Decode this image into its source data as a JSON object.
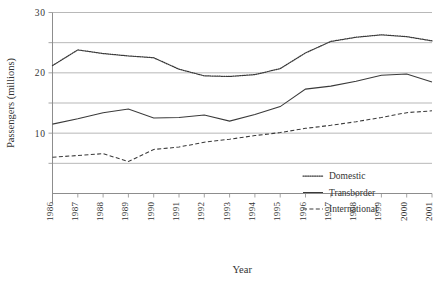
{
  "chart_data": {
    "type": "line",
    "title": "",
    "xlabel": "Year",
    "ylabel": "Passengers (millions)",
    "ylim": [
      0,
      30
    ],
    "ytick_labels": [
      "30",
      "20",
      "10"
    ],
    "ytick_values": [
      30,
      20,
      10
    ],
    "gridlines": [
      30,
      25,
      20,
      15,
      10,
      5
    ],
    "grid": true,
    "legend_position": "lower-right-inside",
    "categories": [
      "1986",
      "1987",
      "1988",
      "1989",
      "1990",
      "1991",
      "1992",
      "1993",
      "1994",
      "1995",
      "1996",
      "1997",
      "1998",
      "1999",
      "2000",
      "2001"
    ],
    "x": [
      1986,
      1987,
      1988,
      1989,
      1990,
      1991,
      1992,
      1993,
      1994,
      1995,
      1996,
      1997,
      1998,
      1999,
      2000,
      2001
    ],
    "series": [
      {
        "name": "Domestic",
        "style": "dotted",
        "values": [
          21.2,
          23.8,
          23.2,
          22.8,
          22.5,
          20.6,
          19.5,
          19.4,
          19.7,
          20.7,
          23.3,
          25.2,
          25.9,
          26.3,
          26.0,
          25.3
        ]
      },
      {
        "name": "Transborder",
        "style": "solid",
        "values": [
          11.5,
          12.4,
          13.4,
          14.0,
          12.5,
          12.6,
          13.0,
          12.0,
          13.1,
          14.4,
          17.3,
          17.8,
          18.6,
          19.6,
          19.8,
          18.5
        ]
      },
      {
        "name": "International",
        "style": "dashed",
        "values": [
          6.0,
          6.3,
          6.6,
          5.3,
          7.3,
          7.7,
          8.5,
          9.0,
          9.6,
          10.1,
          10.8,
          11.3,
          11.9,
          12.6,
          13.4,
          13.7
        ]
      }
    ]
  },
  "legend": {
    "items": [
      {
        "label": "Domestic"
      },
      {
        "label": "Transborder"
      },
      {
        "label": "International"
      }
    ]
  },
  "colors": {
    "ink": "#3a3a3a",
    "grid": "#9a9a9a",
    "axis": "#8d8d8d",
    "background": "#ffffff"
  }
}
